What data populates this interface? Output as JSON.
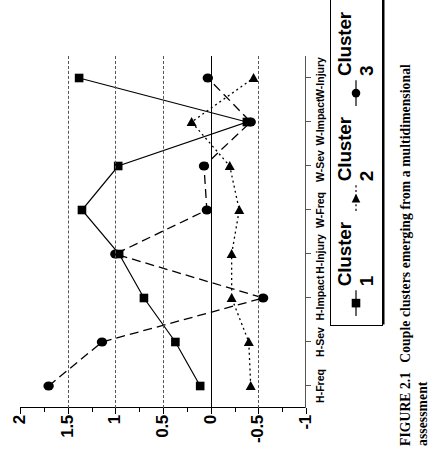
{
  "figure": {
    "caption_number": "FIGURE 2.1",
    "caption_text": "Couple clusters emerging from a multidimensional assessment"
  },
  "legend": {
    "position": "below-plot",
    "entries": [
      {
        "label": "Cluster 1",
        "marker": "square-marker",
        "line": "solid",
        "color": "#000000"
      },
      {
        "label": "Cluster 2",
        "marker": "triangle-marker",
        "line": "dotted",
        "color": "#000000"
      },
      {
        "label": "Cluster 3",
        "marker": "circle-marker",
        "line": "dashed",
        "color": "#000000"
      }
    ]
  },
  "axis": {
    "y_tick_labels": [
      "2",
      "1.5",
      "1",
      "0.5",
      "0",
      "-0.5",
      "-1"
    ],
    "y_tick_values": [
      2,
      1.5,
      1,
      0.5,
      0,
      -0.5,
      -1
    ],
    "y_minor_values": [
      1.75,
      1.25,
      0.75,
      0.25,
      -0.25,
      -0.75
    ],
    "gridline_values": [
      1.5,
      1,
      0.5,
      -0.5
    ],
    "zero_value": 0
  },
  "chart_data": {
    "type": "line",
    "title": "",
    "xlabel": "",
    "ylabel": "",
    "ylim": [
      -1,
      2
    ],
    "grid": true,
    "legend_position": "bottom",
    "categories": [
      "H-Freq",
      "H-Sev",
      "H-Impact",
      "H-Injury",
      "W-Freq",
      "W-Sev",
      "W-Impact",
      "W-Injury"
    ],
    "series": [
      {
        "name": "Cluster 1",
        "marker": "square",
        "linestyle": "solid",
        "color": "#000000",
        "values": [
          0.11,
          0.37,
          0.7,
          0.96,
          1.35,
          0.97,
          -0.38,
          1.38
        ]
      },
      {
        "name": "Cluster 2",
        "marker": "triangle",
        "linestyle": "dotted",
        "color": "#000000",
        "values": [
          -0.42,
          -0.4,
          -0.22,
          -0.22,
          -0.3,
          -0.2,
          0.2,
          -0.45
        ]
      },
      {
        "name": "Cluster 3",
        "marker": "circle",
        "linestyle": "dashed",
        "color": "#000000",
        "values": [
          1.7,
          1.14,
          -0.55,
          1.0,
          0.04,
          0.07,
          -0.42,
          0.03
        ]
      }
    ]
  }
}
